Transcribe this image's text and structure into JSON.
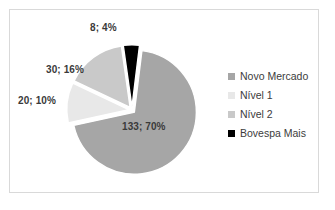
{
  "chart_data": {
    "type": "pie",
    "title": "",
    "subtitle": "",
    "xlabel": "",
    "ylabel": "",
    "grid": false,
    "legend_position": "right",
    "exploded": true,
    "start_angle_deg": 7,
    "categories": [
      "Novo Mercado",
      "Nível 1",
      "Nível 2",
      "Bovespa Mais"
    ],
    "values": [
      133,
      20,
      30,
      8
    ],
    "percentages": [
      70,
      10,
      16,
      4
    ],
    "colors": [
      "#a6a6a6",
      "#e8e8e8",
      "#c9c9c9",
      "#000000"
    ],
    "slices": [
      {
        "name": "Novo Mercado",
        "value": 133,
        "percent": 70,
        "label": "133; 70%",
        "color": "#a6a6a6"
      },
      {
        "name": "Nível 1",
        "value": 20,
        "percent": 10,
        "label": "20; 10%",
        "color": "#e8e8e8"
      },
      {
        "name": "Nível 2",
        "value": 30,
        "percent": 16,
        "label": "30; 16%",
        "color": "#c9c9c9"
      },
      {
        "name": "Bovespa Mais",
        "value": 8,
        "percent": 4,
        "label": "8; 4%",
        "color": "#000000"
      }
    ]
  },
  "legend": {
    "items": [
      {
        "label": "Novo Mercado",
        "color": "#a6a6a6"
      },
      {
        "label": "Nível 1",
        "color": "#e8e8e8"
      },
      {
        "label": "Nível 2",
        "color": "#c9c9c9"
      },
      {
        "label": "Bovespa Mais",
        "color": "#000000"
      }
    ]
  },
  "frame": {
    "border_color": "#d9d9d9",
    "background": "#ffffff"
  }
}
